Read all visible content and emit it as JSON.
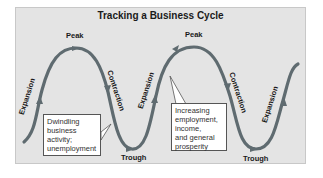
{
  "diagram": {
    "title": "Tracking a Business Cycle",
    "colors": {
      "background": "#e4e4e4",
      "curve": "#5f6b70",
      "text": "#1a1a1a",
      "callout_bg": "#ffffff"
    },
    "phase_labels": {
      "peak_1": "Peak",
      "peak_2": "Peak",
      "trough_1": "Trough",
      "trough_2": "Trough",
      "expansion_1": "Expansion",
      "expansion_2": "Expansion",
      "expansion_3": "Expansion",
      "contraction_1": "Contraction",
      "contraction_2": "Contraction"
    },
    "callouts": {
      "contraction_note": {
        "lines": [
          "Dwindling",
          "business",
          "activity;",
          "unemployment"
        ]
      },
      "expansion_note": {
        "lines": [
          "Increasing",
          "employment,",
          "income,",
          "and general",
          "prosperity"
        ]
      }
    }
  }
}
